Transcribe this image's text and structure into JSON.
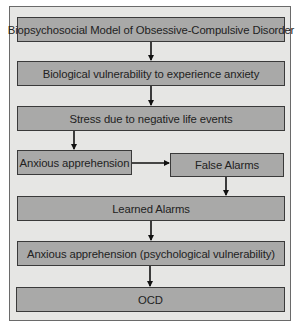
{
  "diagram": {
    "title": "Biopsychosocial Model of Obsessive-Compulsive Disorder",
    "nodes": [
      {
        "id": "title",
        "label": "Biopsychosocial Model of Obsessive-Compulsive Disorder"
      },
      {
        "id": "bio",
        "label": "Biological vulnerability to experience anxiety"
      },
      {
        "id": "stress",
        "label": "Stress due to negative life events"
      },
      {
        "id": "anx1",
        "label": "Anxious apprehension"
      },
      {
        "id": "false",
        "label": "False Alarms"
      },
      {
        "id": "learned",
        "label": "Learned Alarms"
      },
      {
        "id": "anx2",
        "label": "Anxious apprehension (psychological vulnerability)"
      },
      {
        "id": "ocd",
        "label": "OCD"
      }
    ],
    "edges": [
      {
        "from": "title",
        "to": "bio"
      },
      {
        "from": "bio",
        "to": "stress"
      },
      {
        "from": "stress",
        "to": "anx1"
      },
      {
        "from": "anx1",
        "to": "false"
      },
      {
        "from": "false",
        "to": "learned"
      },
      {
        "from": "learned",
        "to": "anx2"
      },
      {
        "from": "anx2",
        "to": "ocd"
      }
    ],
    "colors": {
      "frame_bg": "#e6e6e4",
      "box_fill": "#a9a9a8",
      "box_border": "#3a3a3a",
      "arrow": "#111111"
    }
  }
}
